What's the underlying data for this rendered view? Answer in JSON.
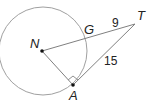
{
  "diagram": {
    "type": "geometry-tangent-circle",
    "circle": {
      "center_label": "N",
      "stroke": "#999999"
    },
    "points": {
      "N": "N",
      "G": "G",
      "T": "T",
      "A": "A"
    },
    "segments": {
      "GT_length": "9",
      "AT_length": "15"
    },
    "right_angle_at": "A",
    "line_color": "#777777"
  }
}
